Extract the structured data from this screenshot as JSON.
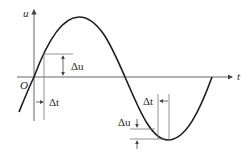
{
  "diagram": {
    "title": "",
    "axes": {
      "vertical_label": "u",
      "horizontal_label": "t",
      "origin_label": "O"
    },
    "curve": {
      "type": "sine",
      "description": "One full period of a sine-like waveform u(t) starting at origin O"
    },
    "annotations": [
      {
        "id": "left-delta-u",
        "label": "Δu",
        "position": "near origin, rising edge"
      },
      {
        "id": "left-delta-t",
        "label": "Δt",
        "position": "near origin, rising edge"
      },
      {
        "id": "right-delta-t",
        "label": "Δt",
        "position": "near trough"
      },
      {
        "id": "right-delta-u",
        "label": "Δu",
        "position": "near trough"
      }
    ],
    "colors": {
      "curve": "#1e1e1e",
      "axis": "#555555",
      "guide": "#777777",
      "text": "#2a2a2a"
    }
  }
}
